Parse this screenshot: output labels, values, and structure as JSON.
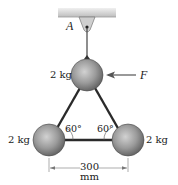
{
  "diagram": {
    "support_label": "A",
    "force_label": "F",
    "masses": {
      "top": "2 kg",
      "bottom_left": "2 kg",
      "bottom_right": "2 kg"
    },
    "angles": {
      "left": "60°",
      "right": "60°"
    },
    "dimension": {
      "value": "300",
      "unit": "mm"
    },
    "colors": {
      "ceiling": "#d4d4d4",
      "sphere": "#8a8a8a",
      "rod": "#2a2a2a"
    }
  }
}
